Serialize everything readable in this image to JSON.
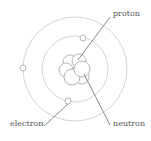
{
  "diagram": {
    "labels": {
      "proton": "proton",
      "neutron": "neutron",
      "electron": "electron"
    },
    "colors": {
      "orbit": "#d4d4d4",
      "particle_stroke": "#b5b5b5",
      "particle_fill": "#ffffff",
      "leader_line": "#6a6a6a",
      "text": "#555555"
    },
    "orbits": [
      {
        "name": "inner",
        "cx": 75,
        "cy": 69,
        "r": 33
      },
      {
        "name": "outer",
        "cx": 75,
        "cy": 69,
        "r": 52
      }
    ],
    "electrons": [
      {
        "cx": 23,
        "cy": 68,
        "r": 3
      },
      {
        "cx": 83,
        "cy": 38,
        "r": 3
      },
      {
        "cx": 68,
        "cy": 101,
        "r": 3
      }
    ],
    "nucleus": [
      {
        "cx": 70,
        "cy": 62,
        "r": 7
      },
      {
        "cx": 79,
        "cy": 61,
        "r": 7
      },
      {
        "cx": 66,
        "cy": 70,
        "r": 7
      },
      {
        "cx": 82,
        "cy": 77,
        "r": 7
      },
      {
        "cx": 72,
        "cy": 77,
        "r": 8
      },
      {
        "cx": 82,
        "cy": 69,
        "r": 8
      }
    ],
    "leaders": [
      {
        "name": "proton",
        "x1": 110,
        "y1": 17,
        "x2": 78,
        "y2": 60
      },
      {
        "name": "neutron",
        "x1": 84,
        "y1": 74,
        "x2": 110,
        "y2": 125
      },
      {
        "name": "electron",
        "x1": 68,
        "y1": 104,
        "x2": 44,
        "y2": 126
      }
    ]
  }
}
